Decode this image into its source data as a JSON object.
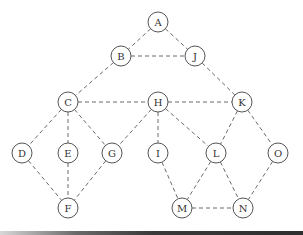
{
  "diagram": {
    "type": "undirected-graph",
    "edge_style": "dashed",
    "node_radius": 10,
    "colors": {
      "edge": "#6a6a6a",
      "node_stroke": "#555555",
      "node_fill": "#ffffff",
      "label": "#333333"
    },
    "nodes": [
      {
        "id": "A",
        "label": "A",
        "x": 158,
        "y": 22
      },
      {
        "id": "B",
        "label": "B",
        "x": 121,
        "y": 56
      },
      {
        "id": "J",
        "label": "J",
        "x": 195,
        "y": 56
      },
      {
        "id": "C",
        "label": "C",
        "x": 68,
        "y": 102
      },
      {
        "id": "H",
        "label": "H",
        "x": 158,
        "y": 102
      },
      {
        "id": "K",
        "label": "K",
        "x": 242,
        "y": 102
      },
      {
        "id": "D",
        "label": "D",
        "x": 22,
        "y": 153
      },
      {
        "id": "E",
        "label": "E",
        "x": 68,
        "y": 153
      },
      {
        "id": "G",
        "label": "G",
        "x": 112,
        "y": 153
      },
      {
        "id": "I",
        "label": "I",
        "x": 158,
        "y": 153
      },
      {
        "id": "L",
        "label": "L",
        "x": 216,
        "y": 153
      },
      {
        "id": "O",
        "label": "O",
        "x": 278,
        "y": 153
      },
      {
        "id": "F",
        "label": "F",
        "x": 68,
        "y": 208
      },
      {
        "id": "M",
        "label": "M",
        "x": 182,
        "y": 208
      },
      {
        "id": "N",
        "label": "N",
        "x": 243,
        "y": 208
      }
    ],
    "edges": [
      [
        "A",
        "B"
      ],
      [
        "A",
        "J"
      ],
      [
        "B",
        "J"
      ],
      [
        "B",
        "C"
      ],
      [
        "J",
        "K"
      ],
      [
        "C",
        "H"
      ],
      [
        "H",
        "K"
      ],
      [
        "C",
        "D"
      ],
      [
        "C",
        "E"
      ],
      [
        "C",
        "G"
      ],
      [
        "H",
        "G"
      ],
      [
        "H",
        "I"
      ],
      [
        "H",
        "L"
      ],
      [
        "K",
        "L"
      ],
      [
        "K",
        "O"
      ],
      [
        "D",
        "F"
      ],
      [
        "E",
        "F"
      ],
      [
        "G",
        "F"
      ],
      [
        "I",
        "M"
      ],
      [
        "L",
        "M"
      ],
      [
        "L",
        "N"
      ],
      [
        "O",
        "N"
      ],
      [
        "M",
        "N"
      ]
    ]
  }
}
